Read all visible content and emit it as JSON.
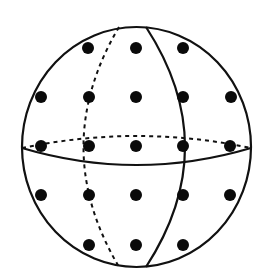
{
  "figure": {
    "colors": {
      "line": "#111111",
      "dot": "#0a0a0a",
      "background": "#ffffff"
    },
    "sphere": {
      "cx": 136.5,
      "cy": 147,
      "rx": 114.5,
      "ry": 120
    },
    "equator": {
      "front_solid": "M22 148 Q136.5 182 251 148",
      "back_dashed": "M22 148 Q136.5 124 251 148"
    },
    "meridian": {
      "front_solid": "M146 27 Q224 147 146 267",
      "back_dashed": "M119 27 Q48 147 119 267"
    },
    "dots": [
      {
        "x": 88,
        "y": 48
      },
      {
        "x": 136,
        "y": 48
      },
      {
        "x": 183,
        "y": 48
      },
      {
        "x": 41,
        "y": 97
      },
      {
        "x": 89,
        "y": 97
      },
      {
        "x": 136,
        "y": 97
      },
      {
        "x": 183,
        "y": 97
      },
      {
        "x": 231,
        "y": 97
      },
      {
        "x": 41,
        "y": 146
      },
      {
        "x": 89,
        "y": 146
      },
      {
        "x": 136,
        "y": 146
      },
      {
        "x": 183,
        "y": 146
      },
      {
        "x": 230,
        "y": 146
      },
      {
        "x": 41,
        "y": 195
      },
      {
        "x": 89,
        "y": 195
      },
      {
        "x": 136,
        "y": 195
      },
      {
        "x": 183,
        "y": 195
      },
      {
        "x": 230,
        "y": 195
      },
      {
        "x": 89,
        "y": 245
      },
      {
        "x": 136,
        "y": 245
      },
      {
        "x": 183,
        "y": 245
      }
    ],
    "dot_radius": 6
  }
}
